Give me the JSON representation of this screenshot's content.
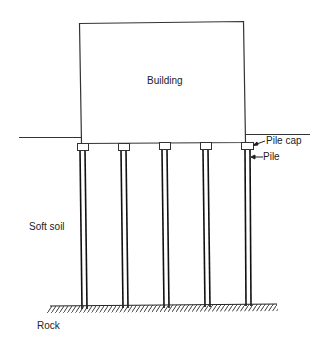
{
  "diagram": {
    "type": "pile foundation cross-section",
    "labels": {
      "building": "Building",
      "pile_cap": "Pile cap",
      "pile": "Pile",
      "soft_soil": "Soft soil",
      "rock": "Rock"
    },
    "pile_count": 5,
    "colors": {
      "line": "#222222",
      "background": "#ffffff"
    }
  }
}
